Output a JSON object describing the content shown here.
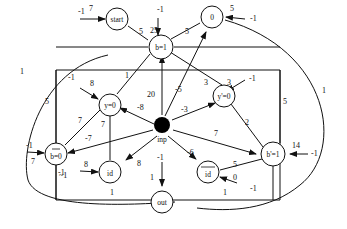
{
  "diagram": {
    "nodes": {
      "start": {
        "label": "start"
      },
      "b1": {
        "label": "b=1"
      },
      "zero": {
        "label": "0"
      },
      "y0": {
        "label": "y=0"
      },
      "yp0": {
        "label": "y'=0"
      },
      "inp": {
        "label": "inp"
      },
      "nb0": {
        "label": "b=0"
      },
      "bp1": {
        "label": "b'=1"
      },
      "id1": {
        "label": "id"
      },
      "nid": {
        "label": "id"
      },
      "out": {
        "label": "out"
      }
    },
    "labels": {
      "start_in_bias": "-1",
      "start_in_w": "7",
      "start_b1": "5",
      "b1_in_bias": "-1",
      "b1_in_w": "25",
      "b1_zero": "5",
      "zero_in_w": "5",
      "zero_in_bias": "-1",
      "inp_b1": "20",
      "inp_zero": "-5",
      "b1_yp0": "3",
      "yp0_in_w": "3",
      "yp0_in_bias": "-1",
      "inp_yp0": "-3",
      "b1_y0": "1",
      "y0_in_bias": "-1",
      "y0_in_w": "8",
      "inp_y0": "-8",
      "y0_nb0": "7",
      "y0_id": "7",
      "inp_nb0": "-7",
      "nb0_in_bias": "-1",
      "nb0_in_w": "7",
      "nb0_id": "~1",
      "id_in_w": "8",
      "id_in_bias": "-1",
      "inp_id": "8",
      "inp_out": "-1",
      "out_in_w": "1",
      "inp_nid": "-6",
      "inp_bp1": "7",
      "yp0_bp1": "2",
      "bp1_in_w": "14",
      "bp1_in_bias": "-1",
      "nid_bp1": "5",
      "nid_in_w": "0",
      "nid_in_bias": "-1",
      "id_out": "1",
      "nid_out": "1",
      "left_loop": "1",
      "left_rect": "5",
      "right_loop": "1",
      "right_rect": "5"
    }
  }
}
